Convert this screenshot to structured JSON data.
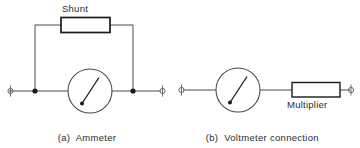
{
  "figure": {
    "background_color": "#ffffff",
    "line_color": "#3a3a3a",
    "box_stroke_color": "#1a1a1a",
    "text_color": "#2b2b2b",
    "diagrams": [
      {
        "id": "ammeter",
        "caption_prefix": "(a)",
        "caption_line1": "Ammeter",
        "caption_line2": "connection",
        "component_label": "Shunt",
        "meter_type": "ammeter",
        "terminals": 2,
        "junction_dots": 2
      },
      {
        "id": "voltmeter",
        "caption_prefix": "(b)",
        "caption_line1": "Voltmeter connection",
        "caption_line2": "",
        "component_label": "Multiplier",
        "meter_type": "voltmeter",
        "terminals": 2,
        "junction_dots": 0
      }
    ]
  },
  "labels": {
    "shunt": "Shunt",
    "multiplier": "Multiplier"
  },
  "captions": {
    "a_prefix": "(a)",
    "a_line1": "Ammeter",
    "a_line2": "connection",
    "b_prefix": "(b)",
    "b_line1": "Voltmeter connection"
  },
  "icons": {
    "terminal": "binding-post-terminal-icon",
    "meter": "analog-meter-icon",
    "resistor": "resistor-box-icon",
    "junction": "junction-dot-icon"
  }
}
